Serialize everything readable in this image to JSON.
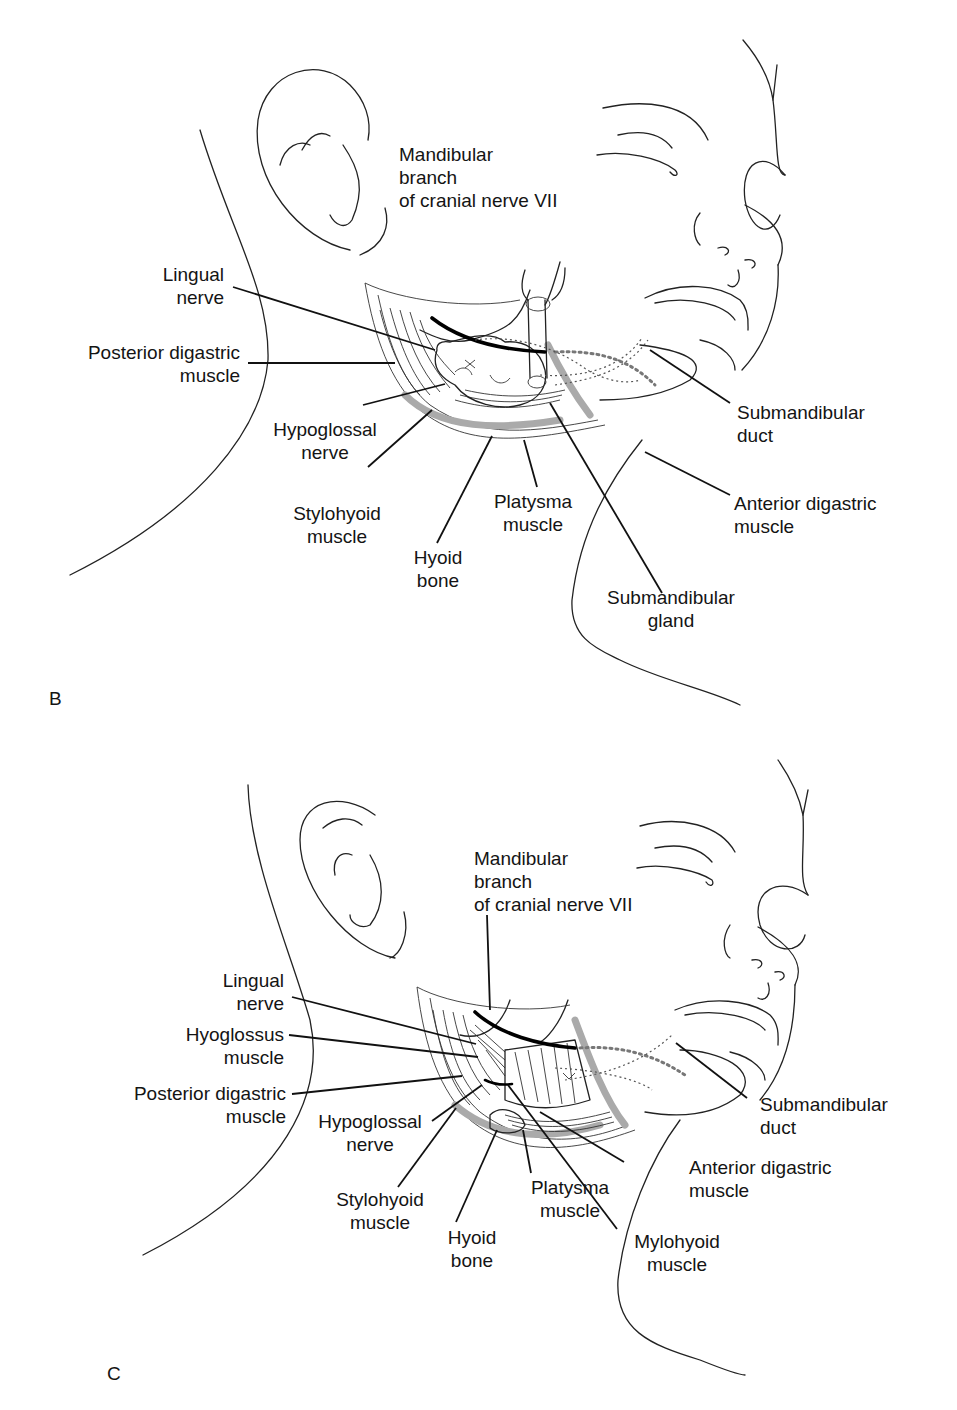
{
  "figure": {
    "panels": [
      {
        "id": "B",
        "letter": "B",
        "labels": {
          "mandibular_branch": [
            "Mandibular",
            "branch",
            "of cranial nerve VII"
          ],
          "lingual_nerve": [
            "Lingual",
            "nerve"
          ],
          "posterior_digastric": [
            "Posterior digastric",
            "muscle"
          ],
          "hypoglossal_nerve": [
            "Hypoglossal",
            "nerve"
          ],
          "stylohyoid_muscle": [
            "Stylohyoid",
            "muscle"
          ],
          "hyoid_bone": [
            "Hyoid",
            "bone"
          ],
          "platysma_muscle": [
            "Platysma",
            "muscle"
          ],
          "submandibular_duct": [
            "Submandibular",
            "duct"
          ],
          "anterior_digastric": [
            "Anterior digastric",
            "muscle"
          ],
          "submandibular_gland": [
            "Submandibular",
            "gland"
          ]
        }
      },
      {
        "id": "C",
        "letter": "C",
        "labels": {
          "mandibular_branch": [
            "Mandibular",
            "branch",
            "of cranial nerve VII"
          ],
          "lingual_nerve": [
            "Lingual",
            "nerve"
          ],
          "hyoglossus_muscle": [
            "Hyoglossus",
            "muscle"
          ],
          "posterior_digastric": [
            "Posterior digastric",
            "muscle"
          ],
          "hypoglossal_nerve": [
            "Hypoglossal",
            "nerve"
          ],
          "stylohyoid_muscle": [
            "Stylohyoid",
            "muscle"
          ],
          "hyoid_bone": [
            "Hyoid",
            "bone"
          ],
          "platysma_muscle": [
            "Platysma",
            "muscle"
          ],
          "submandibular_duct": [
            "Submandibular",
            "duct"
          ],
          "anterior_digastric": [
            "Anterior digastric",
            "muscle"
          ],
          "mylohyoid_muscle": [
            "Mylohyoid",
            "muscle"
          ]
        }
      }
    ]
  }
}
